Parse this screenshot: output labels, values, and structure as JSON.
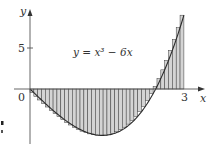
{
  "figure": {
    "equation_label": "y = x³ − 6x",
    "x_axis_label": "x",
    "y_axis_label": "y",
    "origin_label": "0",
    "x_tick_label": "3",
    "y_tick_label": "5"
  },
  "chart_data": {
    "type": "bar",
    "function": "x^3 - 6x",
    "interval": [
      0,
      3
    ],
    "n_rectangles": 40,
    "sample_point": "right endpoint",
    "xlabel": "x",
    "ylabel": "y",
    "x_ticks": [
      0,
      3
    ],
    "y_ticks": [
      5
    ],
    "xlim": [
      0,
      3.3
    ],
    "ylim": [
      -6.5,
      10.5
    ],
    "grid": false,
    "colors": {
      "bar_fill": "#d4d4d4",
      "bar_stroke": "#3a3a3a",
      "curve": "#2a2a2a",
      "axes": "#555555"
    }
  }
}
